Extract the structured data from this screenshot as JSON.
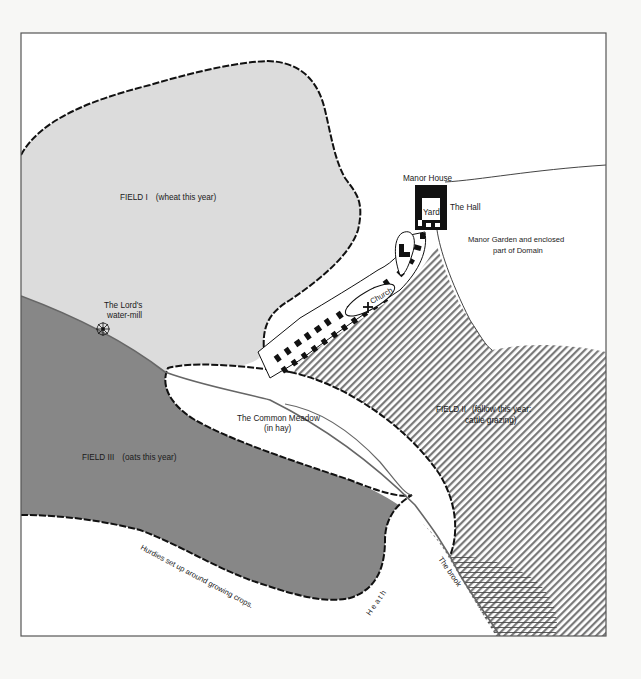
{
  "map": {
    "colors": {
      "page": "#f7f7f5",
      "frame": "#555555",
      "field_one": "#dcdcdc",
      "field_three": "#878787",
      "field_two_hatch": "#777777",
      "boundary": "#111111",
      "building": "#111111",
      "water": "#777777"
    },
    "fields": {
      "field_one": {
        "name": "FIELD I",
        "note": "(wheat this year)"
      },
      "field_two": {
        "name": "FIELD II",
        "note_line1": "(fallow this year:",
        "note_line2": "cattle grazing)"
      },
      "field_three": {
        "name": "FIELD III",
        "note": "(oats this year)"
      }
    },
    "labels": {
      "manor_house": "Manor House",
      "yard": "Yard",
      "the_hall": "The Hall",
      "manor_garden_line1": "Manor Garden and enclosed",
      "manor_garden_line2": "part of Domain",
      "church": "Church",
      "water_mill_line1": "The Lord's",
      "water_mill_line2": "water-mill",
      "common_meadow_line1": "The Common Meadow",
      "common_meadow_line2": "(in hay)",
      "hurdles": "Hurdies set up around growing crops.",
      "heath": "H e a t h",
      "brook": "The brook"
    },
    "icons": {
      "water_mill": "water-wheel-icon",
      "church": "cross-icon",
      "marsh": "marsh-hatch-pattern"
    }
  }
}
